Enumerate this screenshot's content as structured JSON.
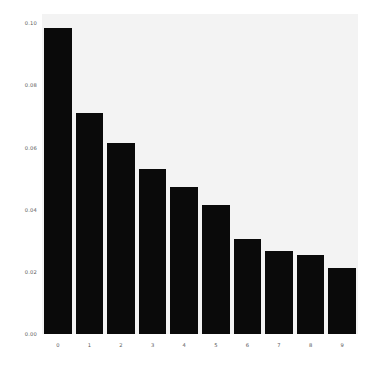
{
  "chart_data": {
    "type": "bar",
    "title": "",
    "subtitle": "",
    "xlabel": "",
    "ylabel": "",
    "categories": [
      "0",
      "1",
      "2",
      "3",
      "4",
      "5",
      "6",
      "7",
      "8",
      "9"
    ],
    "values": [
      0.0985,
      0.0713,
      0.0615,
      0.0531,
      0.0473,
      0.0415,
      0.0305,
      0.0266,
      0.0253,
      0.0214
    ],
    "series": [
      {
        "name": "",
        "values": [
          0.0985,
          0.0713,
          0.0615,
          0.0531,
          0.0473,
          0.0415,
          0.0305,
          0.0266,
          0.0253,
          0.0214
        ]
      }
    ],
    "ylim": [
      0.0,
      0.103
    ],
    "xlim": [
      -0.5,
      9.5
    ],
    "ytick_labels": [
      "0.00",
      "0.02",
      "0.04",
      "0.06",
      "0.08",
      "0.10"
    ],
    "ytick_values": [
      0.0,
      0.02,
      0.04,
      0.06,
      0.08,
      0.1
    ],
    "xtick_labels": [
      "0",
      "1",
      "2",
      "3",
      "4",
      "5",
      "6",
      "7",
      "8",
      "9"
    ],
    "grid": false,
    "legend": null,
    "legend_position": "none",
    "annotations": [],
    "bar_color": "#0a0a0a",
    "plot_background": "#f3f3f3",
    "figure_background": "#ffffff",
    "tick_label_color": "#5a5a5a",
    "bar_width_fraction": 0.87
  }
}
